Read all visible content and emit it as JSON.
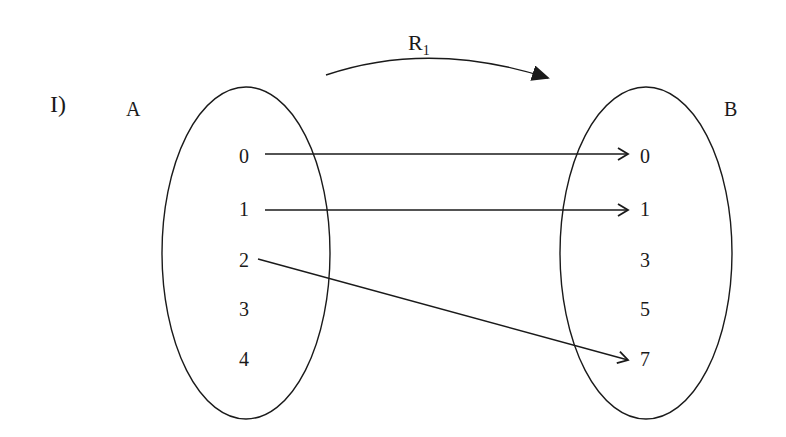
{
  "diagram": {
    "part_label": "I)",
    "relation": {
      "name": "R",
      "subscript": "1"
    },
    "set_a": {
      "name": "A",
      "elements": [
        "0",
        "1",
        "2",
        "3",
        "4"
      ]
    },
    "set_b": {
      "name": "B",
      "elements": [
        "0",
        "1",
        "3",
        "5",
        "7"
      ]
    },
    "mappings": [
      {
        "from": "0",
        "to": "0"
      },
      {
        "from": "1",
        "to": "1"
      },
      {
        "from": "2",
        "to": "7"
      }
    ],
    "colors": {
      "stroke": "#1a1a1a",
      "background": "#ffffff"
    }
  }
}
